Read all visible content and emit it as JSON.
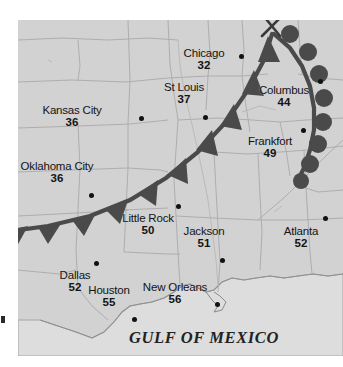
{
  "map": {
    "region_label": "GULF OF MEXICO",
    "background_color": "#d2d2d2",
    "water_color": "#dcdcdc",
    "border_color": "#a8a8a8",
    "front_color": "#4a4a4a"
  },
  "fronts": [
    {
      "name": "cold-front",
      "type": "cold",
      "symbol": "triangles",
      "color": "#4a4a4a",
      "description": "Cold front arcing from southwest Texas northeast through Arkansas, Illinois into the Great Lakes"
    },
    {
      "name": "warm-front",
      "type": "warm",
      "symbol": "semicircles",
      "color": "#4a4a4a",
      "description": "Warm front trailing southeast along the eastern edge past Columbus"
    },
    {
      "name": "low-pressure-marker",
      "type": "marker",
      "symbol": "cross",
      "color": "#3a3a3a",
      "description": "Cross mark at the front apex"
    }
  ],
  "cities": [
    {
      "name": "Chicago",
      "temp": "32",
      "label_x": 186,
      "label_y": 28,
      "dot_x": 221,
      "dot_y": 34,
      "align": "center"
    },
    {
      "name": "St Louis",
      "temp": "37",
      "label_x": 166,
      "label_y": 62,
      "dot_x": 185,
      "dot_y": 95,
      "align": "center"
    },
    {
      "name": "Columbus",
      "temp": "44",
      "label_x": 266,
      "label_y": 65,
      "dot_x": 300,
      "dot_y": 59,
      "align": "center"
    },
    {
      "name": "Kansas City",
      "temp": "36",
      "label_x": 54,
      "label_y": 85,
      "dot_x": 121,
      "dot_y": 96,
      "align": "center"
    },
    {
      "name": "Frankfort",
      "temp": "49",
      "label_x": 252,
      "label_y": 116,
      "dot_x": 283,
      "dot_y": 108,
      "align": "center"
    },
    {
      "name": "Oklahoma City",
      "temp": "36",
      "label_x": 39,
      "label_y": 141,
      "dot_x": 71,
      "dot_y": 173,
      "align": "center"
    },
    {
      "name": "Little Rock",
      "temp": "50",
      "label_x": 130,
      "label_y": 193,
      "dot_x": 158,
      "dot_y": 184,
      "align": "center"
    },
    {
      "name": "Jackson",
      "temp": "51",
      "label_x": 186,
      "label_y": 206,
      "dot_x": 202,
      "dot_y": 238,
      "align": "center"
    },
    {
      "name": "Atlanta",
      "temp": "52",
      "label_x": 283,
      "label_y": 206,
      "dot_x": 305,
      "dot_y": 196,
      "align": "center"
    },
    {
      "name": "Dallas",
      "temp": "52",
      "label_x": 57,
      "label_y": 250,
      "dot_x": 76,
      "dot_y": 241,
      "align": "center"
    },
    {
      "name": "Houston",
      "temp": "55",
      "label_x": 91,
      "label_y": 265,
      "dot_x": 114,
      "dot_y": 297,
      "align": "center"
    },
    {
      "name": "New Orleans",
      "temp": "56",
      "label_x": 157,
      "label_y": 262,
      "dot_x": 197,
      "dot_y": 282,
      "align": "center"
    }
  ],
  "gulf_label": {
    "text": "GULF OF MEXICO",
    "x": 186,
    "y": 318
  }
}
